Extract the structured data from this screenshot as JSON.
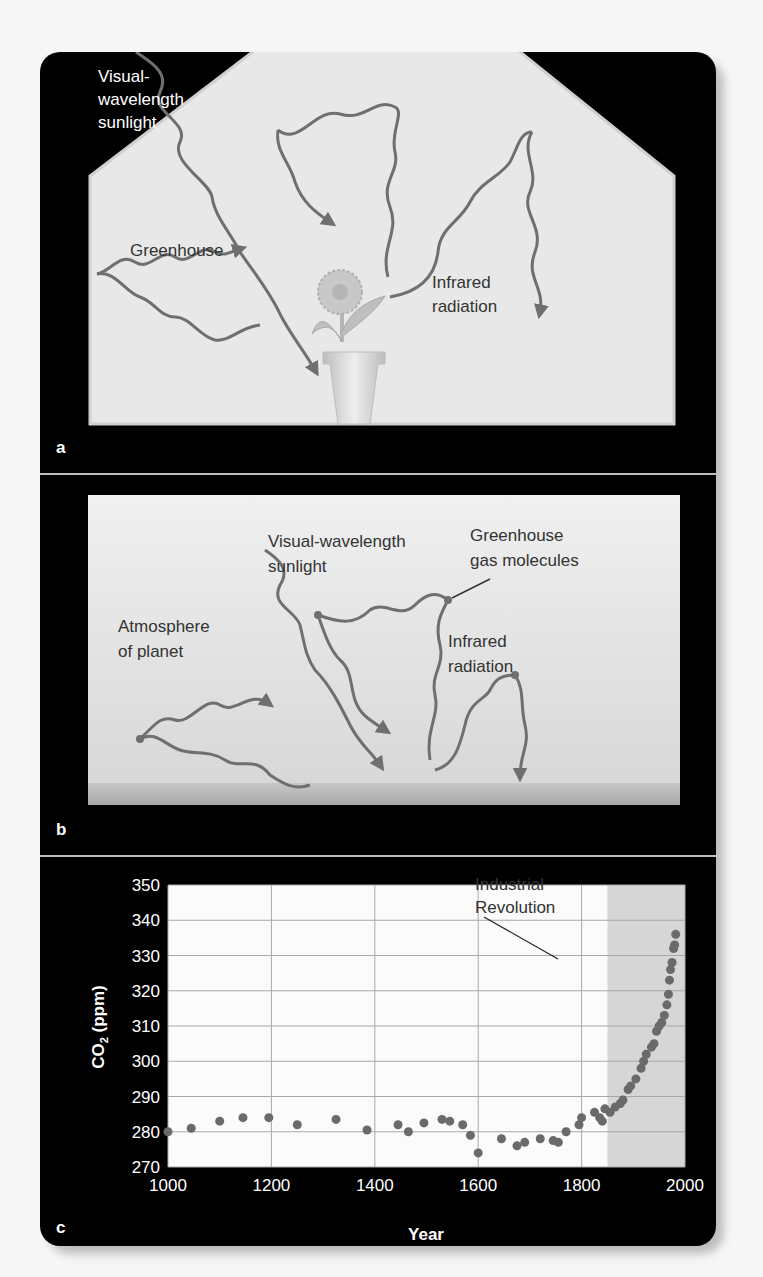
{
  "figure": {
    "panel_a": {
      "letter": "a",
      "labels": {
        "sunlight_line1": "Visual-",
        "sunlight_line2": "wavelength",
        "sunlight_line3": "sunlight",
        "greenhouse": "Greenhouse",
        "infrared_line1": "Infrared",
        "infrared_line2": "radiation"
      }
    },
    "panel_b": {
      "letter": "b",
      "labels": {
        "sunlight_line1": "Visual-wavelength",
        "sunlight_line2": "sunlight",
        "gas_line1": "Greenhouse",
        "gas_line2": "gas molecules",
        "atmosphere_line1": "Atmosphere",
        "atmosphere_line2": "of planet",
        "infrared_line1": "Infrared",
        "infrared_line2": "radiation"
      }
    },
    "panel_c": {
      "letter": "c",
      "annotation_line1": "Industrial",
      "annotation_line2": "Revolution",
      "ylabel_main": "CO",
      "ylabel_sub": "2",
      "ylabel_unit": " (ppm)",
      "xlabel": "Year"
    },
    "colors": {
      "frame": "#000000",
      "panel_fill": "#e6e6e6",
      "wave": "#6f6f6f",
      "dot": "#6a6a6a",
      "shaded_region": "#d6d6d6",
      "grid": "#a8a8a8"
    }
  },
  "chart_data": {
    "type": "scatter",
    "title": "",
    "xlabel": "Year",
    "ylabel": "CO2 (ppm)",
    "xlim": [
      1000,
      2000
    ],
    "ylim": [
      270,
      350
    ],
    "xticks": [
      1000,
      1200,
      1400,
      1600,
      1800,
      2000
    ],
    "yticks": [
      270,
      280,
      290,
      300,
      310,
      320,
      330,
      340,
      350
    ],
    "grid": true,
    "shaded_region": {
      "from": 1850,
      "to": 2000,
      "label": "Industrial Revolution"
    },
    "annotations": [
      {
        "text": "Industrial Revolution",
        "x": 1830,
        "y": 335
      }
    ],
    "x": [
      1000,
      1045,
      1100,
      1145,
      1195,
      1250,
      1325,
      1385,
      1445,
      1465,
      1495,
      1530,
      1545,
      1570,
      1585,
      1600,
      1645,
      1675,
      1690,
      1720,
      1745,
      1755,
      1770,
      1795,
      1800,
      1825,
      1835,
      1840,
      1845,
      1855,
      1865,
      1875,
      1880,
      1890,
      1895,
      1905,
      1915,
      1920,
      1925,
      1935,
      1940,
      1945,
      1950,
      1955,
      1960,
      1965,
      1968,
      1970,
      1972,
      1975,
      1978,
      1980,
      1982
    ],
    "y": [
      280,
      281,
      283,
      284,
      284,
      282,
      283.5,
      280.5,
      282,
      280,
      282.5,
      283.5,
      283,
      282,
      279,
      274,
      278,
      276,
      277,
      278,
      277.5,
      277,
      280,
      282,
      284,
      285.5,
      284,
      283,
      286.5,
      285.5,
      287,
      288,
      289,
      292,
      293,
      295,
      298,
      300,
      302,
      304,
      305,
      308.5,
      310,
      311,
      313,
      316,
      319,
      323,
      326,
      328,
      332,
      333,
      336
    ]
  }
}
